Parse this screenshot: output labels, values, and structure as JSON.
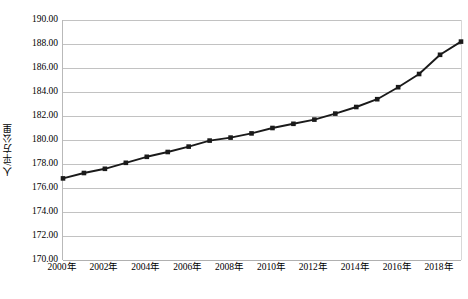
{
  "chart_data": {
    "type": "line",
    "title": "",
    "xlabel": "",
    "ylabel": "人/平方公里",
    "ylim": [
      170.0,
      190.0
    ],
    "ytick_step": 2.0,
    "ytick_labels": [
      "190.00",
      "188.00",
      "186.00",
      "184.00",
      "182.00",
      "180.00",
      "178.00",
      "176.00",
      "174.00",
      "172.00",
      "170.00"
    ],
    "ytick_values": [
      190.0,
      188.0,
      186.0,
      184.0,
      182.0,
      180.0,
      178.0,
      176.0,
      174.0,
      172.0,
      170.0
    ],
    "xtick_labels": [
      "2000年",
      "2002年",
      "2004年",
      "2006年",
      "2008年",
      "2010年",
      "2012年",
      "2014年",
      "2016年",
      "2018年"
    ],
    "xtick_values": [
      2000,
      2002,
      2004,
      2006,
      2008,
      2010,
      2012,
      2014,
      2016,
      2018
    ],
    "x": [
      2000,
      2001,
      2002,
      2003,
      2004,
      2005,
      2006,
      2007,
      2008,
      2009,
      2010,
      2011,
      2012,
      2013,
      2014,
      2015,
      2016,
      2017,
      2018,
      2019
    ],
    "categories": [
      "2000年",
      "2001年",
      "2002年",
      "2003年",
      "2004年",
      "2005年",
      "2006年",
      "2007年",
      "2008年",
      "2009年",
      "2010年",
      "2011年",
      "2012年",
      "2013年",
      "2014年",
      "2015年",
      "2016年",
      "2017年",
      "2018年",
      "2019年"
    ],
    "values": [
      176.8,
      177.25,
      177.6,
      178.1,
      178.6,
      179.0,
      179.45,
      179.95,
      180.2,
      180.55,
      181.0,
      181.35,
      181.7,
      182.2,
      182.75,
      183.4,
      184.4,
      185.5,
      187.1,
      188.2
    ],
    "series": [
      {
        "name": "人口密度",
        "values": [
          176.8,
          177.25,
          177.6,
          178.1,
          178.6,
          179.0,
          179.45,
          179.95,
          180.2,
          180.55,
          181.0,
          181.35,
          181.7,
          182.2,
          182.75,
          183.4,
          184.4,
          185.5,
          187.1,
          188.2
        ]
      }
    ],
    "grid": true,
    "grid_axis": "y",
    "legend": false,
    "legend_position": "none",
    "marker": "square",
    "line_color": "#1a1a1a",
    "marker_color": "#1a1a1a",
    "grid_color": "#c2c2c2",
    "background_color": "#ffffff"
  }
}
